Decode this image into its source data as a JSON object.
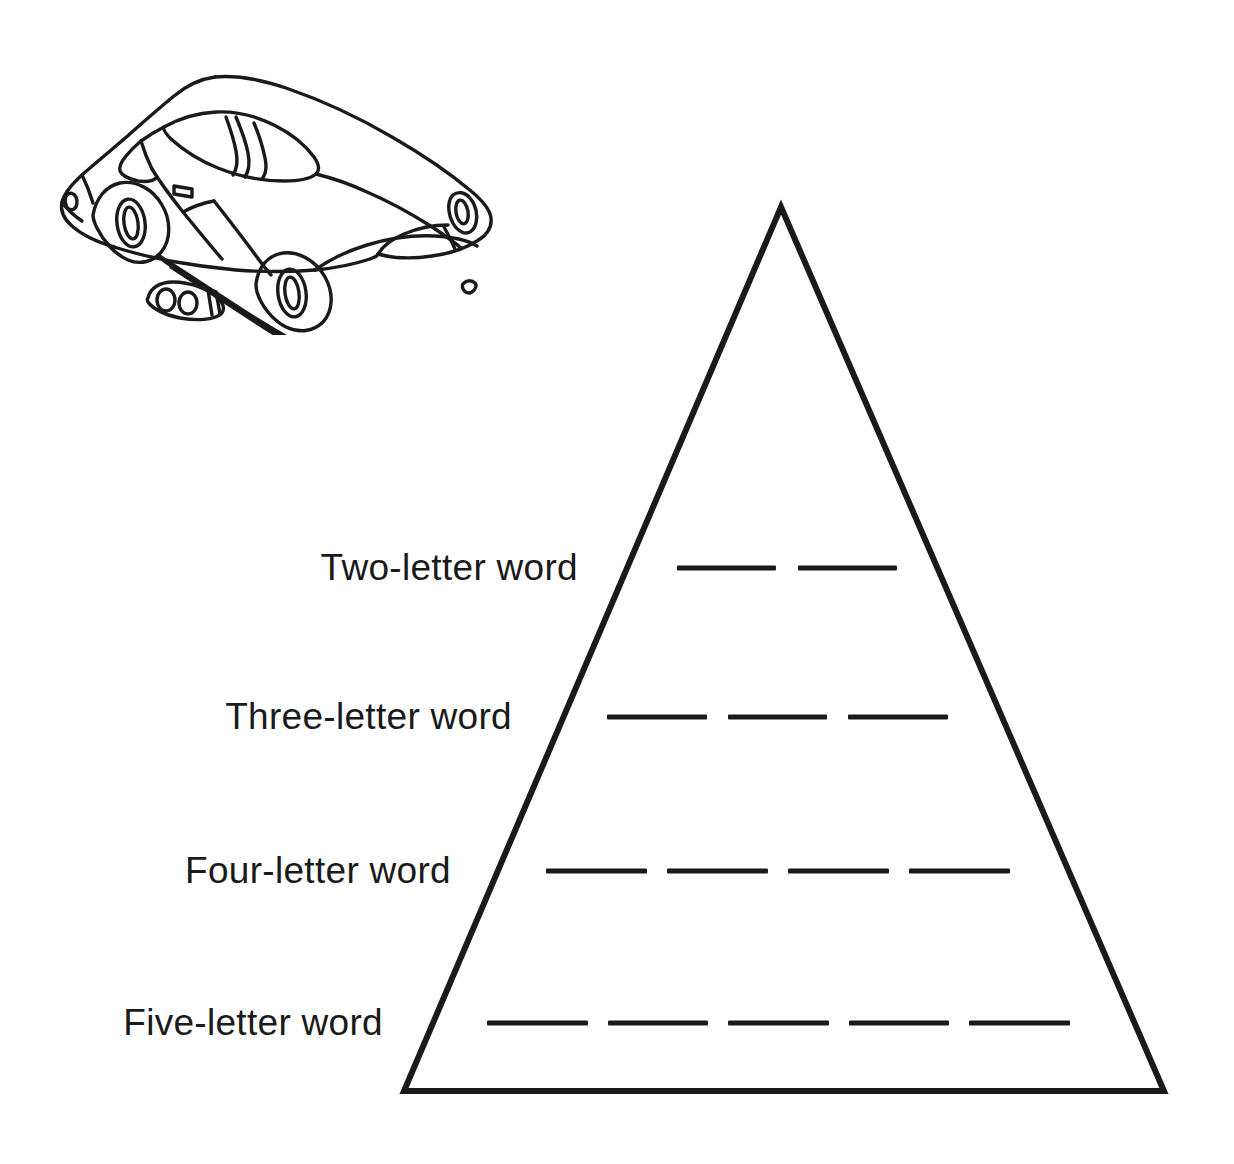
{
  "page": {
    "background_color": "#ffffff",
    "ink_color": "#1a1a1a",
    "width": 1234,
    "height": 1164
  },
  "illustration": {
    "name": "car-line-drawing",
    "subject": "convertible sports car",
    "style": "black-and-white line art",
    "alt": "Line drawing of a convertible sports car seen from a front three-quarter angle"
  },
  "pyramid": {
    "name": "word-pyramid",
    "apex": {
      "x": 781,
      "y": 207
    },
    "base_left": {
      "x": 404,
      "y": 1091
    },
    "base_right": {
      "x": 1164,
      "y": 1091
    },
    "stroke_width": 6,
    "stroke_color": "#1a1a1a",
    "fill": "none"
  },
  "rows": [
    {
      "label": "Two-letter word",
      "letter_count": 2,
      "label_right_x": 578,
      "y": 568,
      "blanks_start_x": 677,
      "blanks_end_x": 897,
      "blank_width": 100,
      "blank_gap": 22
    },
    {
      "label": "Three-letter word",
      "letter_count": 3,
      "label_right_x": 512,
      "y": 717,
      "blanks_start_x": 607,
      "blanks_end_x": 948,
      "blank_width": 100,
      "blank_gap": 21
    },
    {
      "label": "Four-letter word",
      "letter_count": 4,
      "label_right_x": 451,
      "y": 871,
      "blanks_start_x": 546,
      "blanks_end_x": 1010,
      "blank_width": 101,
      "blank_gap": 20
    },
    {
      "label": "Five-letter word",
      "letter_count": 5,
      "label_right_x": 383,
      "y": 1023,
      "blanks_start_x": 487,
      "blanks_end_x": 1070,
      "blank_width": 101,
      "blank_gap": 20
    }
  ]
}
